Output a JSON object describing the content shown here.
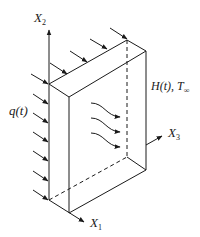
{
  "diagram": {
    "labels": {
      "x2_main": "X",
      "x2_sub": "2",
      "x1_main": "X",
      "x1_sub": "1",
      "x3_main": "X",
      "x3_sub": "3",
      "heat_flux": "q(t)",
      "convection": "H(t),  T",
      "convection_sub": "∞"
    },
    "colors": {
      "stroke": "#1a1a1a",
      "background": "#ffffff"
    }
  }
}
